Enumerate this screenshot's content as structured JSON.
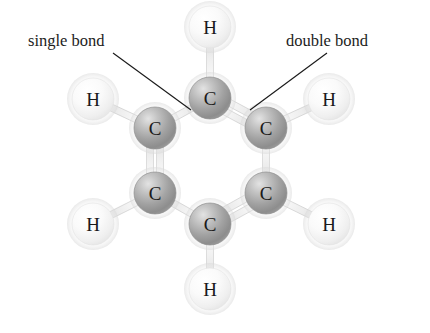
{
  "figure": {
    "kind": "ball-and-stick molecular structure diagram",
    "molecule_name": "benzene",
    "formula": "C6H6",
    "background_color": "#ffffff"
  },
  "annotations": [
    {
      "id": "single-bond",
      "label": "single bond",
      "text_x": 28,
      "text_y": 46,
      "leader": {
        "x1": 113,
        "y1": 53,
        "x2": 191,
        "y2": 110
      }
    },
    {
      "id": "double-bond",
      "label": "double bond",
      "text_x": 286,
      "text_y": 46,
      "leader": {
        "x1": 327,
        "y1": 53,
        "x2": 250,
        "y2": 110
      }
    }
  ],
  "chart_data": {
    "type": "diagram",
    "title": "",
    "atoms": [
      {
        "id": "C1",
        "element": "C",
        "label": "C",
        "x": 210,
        "y": 98,
        "radius": 21,
        "color": "#a8a8a8"
      },
      {
        "id": "C2",
        "element": "C",
        "label": "C",
        "x": 266,
        "y": 128,
        "radius": 21,
        "color": "#a8a8a8"
      },
      {
        "id": "C3",
        "element": "C",
        "label": "C",
        "x": 266,
        "y": 193,
        "radius": 21,
        "color": "#a8a8a8"
      },
      {
        "id": "C4",
        "element": "C",
        "label": "C",
        "x": 210,
        "y": 224,
        "radius": 21,
        "color": "#a8a8a8"
      },
      {
        "id": "C5",
        "element": "C",
        "label": "C",
        "x": 155,
        "y": 193,
        "radius": 21,
        "color": "#a8a8a8"
      },
      {
        "id": "C6",
        "element": "C",
        "label": "C",
        "x": 155,
        "y": 128,
        "radius": 21,
        "color": "#a8a8a8"
      },
      {
        "id": "H1",
        "element": "H",
        "label": "H",
        "x": 210,
        "y": 27,
        "radius": 21,
        "color": "#f2f2f2"
      },
      {
        "id": "H2",
        "element": "H",
        "label": "H",
        "x": 329,
        "y": 99,
        "radius": 21,
        "color": "#f2f2f2"
      },
      {
        "id": "H3",
        "element": "H",
        "label": "H",
        "x": 329,
        "y": 224,
        "radius": 21,
        "color": "#f2f2f2"
      },
      {
        "id": "H4",
        "element": "H",
        "label": "H",
        "x": 210,
        "y": 289,
        "radius": 21,
        "color": "#f2f2f2"
      },
      {
        "id": "H5",
        "element": "H",
        "label": "H",
        "x": 93,
        "y": 224,
        "radius": 21,
        "color": "#f2f2f2"
      },
      {
        "id": "H6",
        "element": "H",
        "label": "H",
        "x": 93,
        "y": 99,
        "radius": 21,
        "color": "#f2f2f2"
      }
    ],
    "bonds": [
      {
        "id": "C1-C2",
        "from": "C1",
        "to": "C2",
        "order": 2,
        "kind": "double bond"
      },
      {
        "id": "C2-C3",
        "from": "C2",
        "to": "C3",
        "order": 1,
        "kind": "single bond"
      },
      {
        "id": "C3-C4",
        "from": "C3",
        "to": "C4",
        "order": 2,
        "kind": "double bond"
      },
      {
        "id": "C4-C5",
        "from": "C4",
        "to": "C5",
        "order": 1,
        "kind": "single bond"
      },
      {
        "id": "C5-C6",
        "from": "C5",
        "to": "C6",
        "order": 2,
        "kind": "double bond"
      },
      {
        "id": "C6-C1",
        "from": "C6",
        "to": "C1",
        "order": 1,
        "kind": "single bond"
      },
      {
        "id": "C1-H1",
        "from": "C1",
        "to": "H1",
        "order": 1,
        "kind": "single bond"
      },
      {
        "id": "C2-H2",
        "from": "C2",
        "to": "H2",
        "order": 1,
        "kind": "single bond"
      },
      {
        "id": "C3-H3",
        "from": "C3",
        "to": "H3",
        "order": 1,
        "kind": "single bond"
      },
      {
        "id": "C4-H4",
        "from": "C4",
        "to": "H4",
        "order": 1,
        "kind": "single bond"
      },
      {
        "id": "C5-H5",
        "from": "C5",
        "to": "H5",
        "order": 1,
        "kind": "single bond"
      },
      {
        "id": "C6-H6",
        "from": "C6",
        "to": "H6",
        "order": 1,
        "kind": "single bond"
      }
    ],
    "bond_style": {
      "stick_width": 7,
      "double_offset": 5,
      "stick_color": "#e9e9e9",
      "stick_edge_color": "#bdbdbd"
    }
  }
}
